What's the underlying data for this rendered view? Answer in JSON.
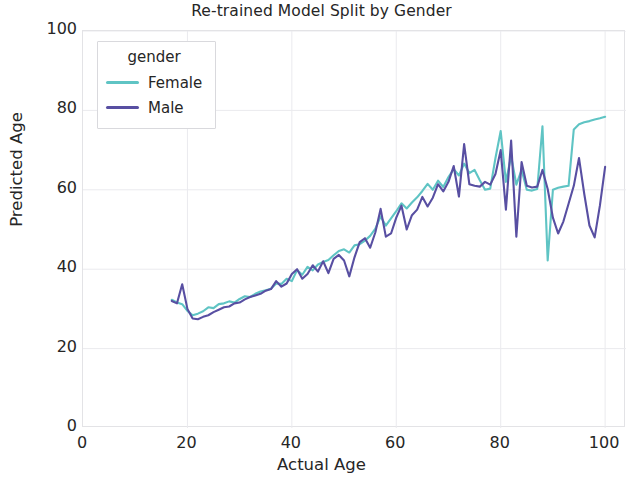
{
  "chart_data": {
    "type": "line",
    "title": "Re-trained Model Split by Gender",
    "xlabel": "Actual Age",
    "ylabel": "Predicted Age",
    "xlim": [
      0,
      104
    ],
    "ylim": [
      0,
      100
    ],
    "xticks": [
      0,
      20,
      40,
      60,
      80,
      100
    ],
    "yticks": [
      0,
      20,
      40,
      60,
      80,
      100
    ],
    "grid": true,
    "legend": {
      "title": "gender",
      "position": "upper-left-inside",
      "entries": [
        {
          "name": "Female",
          "color": "#5fc4c4"
        },
        {
          "name": "Male",
          "color": "#584fa2"
        }
      ]
    },
    "series": [
      {
        "name": "Female",
        "color": "#5fc4c4",
        "x": [
          17,
          18,
          19,
          20,
          21,
          22,
          23,
          24,
          25,
          26,
          27,
          28,
          29,
          30,
          31,
          32,
          33,
          34,
          35,
          36,
          37,
          38,
          39,
          40,
          41,
          42,
          43,
          44,
          45,
          46,
          47,
          48,
          49,
          50,
          51,
          52,
          53,
          54,
          55,
          56,
          57,
          58,
          59,
          60,
          61,
          62,
          63,
          64,
          65,
          66,
          67,
          68,
          69,
          70,
          71,
          72,
          73,
          74,
          75,
          76,
          77,
          78,
          79,
          80,
          81,
          82,
          83,
          84,
          85,
          86,
          87,
          88,
          89,
          90,
          91,
          92,
          93,
          94,
          95,
          96,
          97,
          98,
          99,
          100
        ],
        "values": [
          32.3,
          31.6,
          31.2,
          29.5,
          28.4,
          28.8,
          29.4,
          30.4,
          30.2,
          31.2,
          31.4,
          31.9,
          31.6,
          32.5,
          33.2,
          33.0,
          33.8,
          34.4,
          34.7,
          35.1,
          36.4,
          36.3,
          37.6,
          37.0,
          39.8,
          38.6,
          40.6,
          39.7,
          41.2,
          41.8,
          42.3,
          43.5,
          44.6,
          45.0,
          44.2,
          46.0,
          46.3,
          47.2,
          48.4,
          50.2,
          53.3,
          51.0,
          52.8,
          54.6,
          56.6,
          55.3,
          56.8,
          58.1,
          59.7,
          61.5,
          60.0,
          62.3,
          60.7,
          63.2,
          65.2,
          63.6,
          66.6,
          64.2,
          65.0,
          62.4,
          60.0,
          60.3,
          68.0,
          74.8,
          62.0,
          68.5,
          61.3,
          65.0,
          60.0,
          59.8,
          60.2,
          76.0,
          42.2,
          60.0,
          60.5,
          60.8,
          61.0,
          75.2,
          76.5,
          77.0,
          77.3,
          77.7,
          78.0,
          78.4
        ]
      },
      {
        "name": "Male",
        "color": "#584fa2",
        "x": [
          17,
          18,
          19,
          20,
          21,
          22,
          23,
          24,
          25,
          26,
          27,
          28,
          29,
          30,
          31,
          32,
          33,
          34,
          35,
          36,
          37,
          38,
          39,
          40,
          41,
          42,
          43,
          44,
          45,
          46,
          47,
          48,
          49,
          50,
          51,
          52,
          53,
          54,
          55,
          56,
          57,
          58,
          59,
          60,
          61,
          62,
          63,
          64,
          65,
          66,
          67,
          68,
          69,
          70,
          71,
          72,
          73,
          74,
          75,
          76,
          77,
          78,
          79,
          80,
          81,
          82,
          83,
          84,
          85,
          86,
          87,
          88,
          89,
          90,
          91,
          92,
          93,
          94,
          95,
          96,
          97,
          98,
          99,
          100
        ],
        "values": [
          32.0,
          31.4,
          36.2,
          30.0,
          27.6,
          27.4,
          28.0,
          28.4,
          29.2,
          29.8,
          30.4,
          30.6,
          31.4,
          31.6,
          32.4,
          33.0,
          33.4,
          33.8,
          34.6,
          35.0,
          37.0,
          35.6,
          36.4,
          38.8,
          40.0,
          37.6,
          38.8,
          41.0,
          39.4,
          42.0,
          39.0,
          42.6,
          43.6,
          42.2,
          38.2,
          43.0,
          46.8,
          47.8,
          45.4,
          49.3,
          55.2,
          48.2,
          49.0,
          53.0,
          56.0,
          50.0,
          53.6,
          55.0,
          58.2,
          55.8,
          58.0,
          61.4,
          59.6,
          62.0,
          66.0,
          58.3,
          71.5,
          61.4,
          61.0,
          60.8,
          62.0,
          61.3,
          64.0,
          70.0,
          55.0,
          72.4,
          48.2,
          67.0,
          61.0,
          60.6,
          60.8,
          65.0,
          60.2,
          53.0,
          49.0,
          52.0,
          56.5,
          61.0,
          68.0,
          59.0,
          51.0,
          48.0,
          56.0,
          65.8
        ]
      }
    ]
  }
}
